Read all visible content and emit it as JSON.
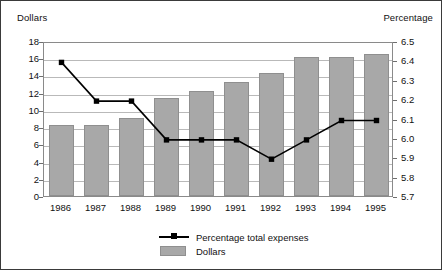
{
  "chart_data": {
    "type": "bar",
    "title": "",
    "subtitle": "",
    "categories": [
      "1986",
      "1987",
      "1988",
      "1989",
      "1990",
      "1991",
      "1992",
      "1993",
      "1994",
      "1995"
    ],
    "xlabel": "",
    "grid": true,
    "legend_position": "bottom-center",
    "axes": {
      "left": {
        "label": "Dollars",
        "ylim": [
          0,
          18
        ],
        "tick_step": 2,
        "ticks": [
          "0",
          "2",
          "4",
          "6",
          "8",
          "10",
          "12",
          "14",
          "16",
          "18"
        ]
      },
      "right": {
        "label": "Percentage",
        "ylim": [
          5.7,
          6.5
        ],
        "tick_step": 0.1,
        "ticks": [
          "5.7",
          "5.8",
          "5.9",
          "6.0",
          "6.1",
          "6.2",
          "6.3",
          "6.4",
          "6.5"
        ]
      }
    },
    "series": [
      {
        "name": "Dollars",
        "type": "bar",
        "axis": "left",
        "color": "#a8a8a8",
        "values": [
          8.2,
          8.3,
          9.1,
          11.4,
          12.2,
          13.3,
          14.3,
          16.2,
          16.1,
          16.5
        ]
      },
      {
        "name": "Percentage total expenses",
        "type": "line",
        "axis": "right",
        "color": "#000000",
        "marker": "square",
        "values": [
          6.4,
          6.2,
          6.2,
          6.0,
          6.0,
          6.0,
          5.9,
          6.0,
          6.1,
          6.1
        ]
      }
    ]
  },
  "legend": {
    "entries": [
      {
        "label": "Percentage total expenses",
        "key": "line-marker"
      },
      {
        "label": "Dollars",
        "key": "swatch"
      }
    ]
  }
}
